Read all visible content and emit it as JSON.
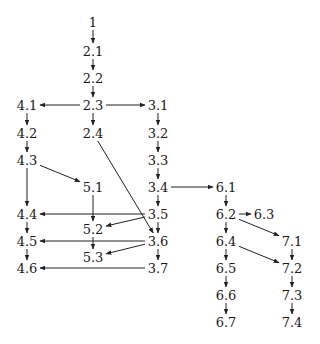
{
  "diagram": {
    "type": "directed-graph",
    "nodes": [
      {
        "id": "1",
        "label": "1",
        "x": 93,
        "y": 22
      },
      {
        "id": "2.1",
        "label": "2.1",
        "x": 93,
        "y": 51
      },
      {
        "id": "2.2",
        "label": "2.2",
        "x": 93,
        "y": 78
      },
      {
        "id": "2.3",
        "label": "2.3",
        "x": 93,
        "y": 105
      },
      {
        "id": "2.4",
        "label": "2.4",
        "x": 93,
        "y": 133
      },
      {
        "id": "3.1",
        "label": "3.1",
        "x": 158,
        "y": 105
      },
      {
        "id": "3.2",
        "label": "3.2",
        "x": 158,
        "y": 133
      },
      {
        "id": "3.3",
        "label": "3.3",
        "x": 158,
        "y": 160
      },
      {
        "id": "3.4",
        "label": "3.4",
        "x": 158,
        "y": 187
      },
      {
        "id": "3.5",
        "label": "3.5",
        "x": 158,
        "y": 214
      },
      {
        "id": "3.6",
        "label": "3.6",
        "x": 158,
        "y": 241
      },
      {
        "id": "3.7",
        "label": "3.7",
        "x": 158,
        "y": 268
      },
      {
        "id": "4.1",
        "label": "4.1",
        "x": 27,
        "y": 105
      },
      {
        "id": "4.2",
        "label": "4.2",
        "x": 27,
        "y": 133
      },
      {
        "id": "4.3",
        "label": "4.3",
        "x": 27,
        "y": 160
      },
      {
        "id": "4.4",
        "label": "4.4",
        "x": 27,
        "y": 214
      },
      {
        "id": "4.5",
        "label": "4.5",
        "x": 27,
        "y": 241
      },
      {
        "id": "4.6",
        "label": "4.6",
        "x": 27,
        "y": 268
      },
      {
        "id": "5.1",
        "label": "5.1",
        "x": 93,
        "y": 187
      },
      {
        "id": "5.2",
        "label": "5.2",
        "x": 93,
        "y": 229
      },
      {
        "id": "5.3",
        "label": "5.3",
        "x": 93,
        "y": 257
      },
      {
        "id": "6.1",
        "label": "6.1",
        "x": 226,
        "y": 187
      },
      {
        "id": "6.2",
        "label": "6.2",
        "x": 226,
        "y": 214
      },
      {
        "id": "6.3",
        "label": "6.3",
        "x": 264,
        "y": 214
      },
      {
        "id": "6.4",
        "label": "6.4",
        "x": 226,
        "y": 241
      },
      {
        "id": "6.5",
        "label": "6.5",
        "x": 226,
        "y": 268
      },
      {
        "id": "6.6",
        "label": "6.6",
        "x": 226,
        "y": 295
      },
      {
        "id": "6.7",
        "label": "6.7",
        "x": 226,
        "y": 322
      },
      {
        "id": "7.1",
        "label": "7.1",
        "x": 292,
        "y": 241
      },
      {
        "id": "7.2",
        "label": "7.2",
        "x": 292,
        "y": 268
      },
      {
        "id": "7.3",
        "label": "7.3",
        "x": 292,
        "y": 295
      },
      {
        "id": "7.4",
        "label": "7.4",
        "x": 292,
        "y": 322
      }
    ],
    "edges": [
      [
        "1",
        "2.1"
      ],
      [
        "2.1",
        "2.2"
      ],
      [
        "2.2",
        "2.3"
      ],
      [
        "2.3",
        "4.1"
      ],
      [
        "2.3",
        "3.1"
      ],
      [
        "2.3",
        "2.4"
      ],
      [
        "4.1",
        "4.2"
      ],
      [
        "4.2",
        "4.3"
      ],
      [
        "4.3",
        "5.1"
      ],
      [
        "4.3",
        "4.4"
      ],
      [
        "4.4",
        "4.5"
      ],
      [
        "4.5",
        "4.6"
      ],
      [
        "3.1",
        "3.2"
      ],
      [
        "3.2",
        "3.3"
      ],
      [
        "3.3",
        "3.4"
      ],
      [
        "3.4",
        "6.1"
      ],
      [
        "3.4",
        "3.5"
      ],
      [
        "3.5",
        "4.4"
      ],
      [
        "3.5",
        "5.2"
      ],
      [
        "3.5",
        "3.6"
      ],
      [
        "3.6",
        "4.5"
      ],
      [
        "3.6",
        "5.3"
      ],
      [
        "3.6",
        "3.7"
      ],
      [
        "3.7",
        "4.6"
      ],
      [
        "2.4",
        "3.6"
      ],
      [
        "5.1",
        "5.2"
      ],
      [
        "5.2",
        "5.3"
      ],
      [
        "6.1",
        "6.2"
      ],
      [
        "6.2",
        "6.3"
      ],
      [
        "6.2",
        "7.1"
      ],
      [
        "6.2",
        "6.4"
      ],
      [
        "6.4",
        "7.2"
      ],
      [
        "6.4",
        "6.5"
      ],
      [
        "6.5",
        "6.6"
      ],
      [
        "6.6",
        "6.7"
      ],
      [
        "7.1",
        "7.2"
      ],
      [
        "7.2",
        "7.3"
      ],
      [
        "7.3",
        "7.4"
      ]
    ],
    "colors": {
      "background": "#ffffff",
      "ink": "#1a1a1a"
    }
  }
}
